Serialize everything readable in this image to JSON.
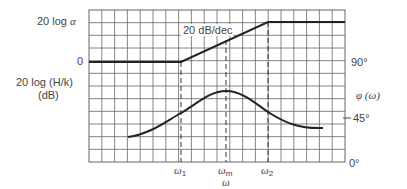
{
  "figure": {
    "left_axis": {
      "top_label_prefix": "20 log ",
      "top_label_var": "α",
      "zero_label": "0",
      "title_line1": "20 log (H/k)",
      "title_line2": "(dB)"
    },
    "right_axis": {
      "title": "φ (ω)",
      "ticks": [
        "90°",
        "45°",
        "0°"
      ]
    },
    "x_axis": {
      "title": "ω",
      "markers": [
        {
          "sym": "ω",
          "sub": "1"
        },
        {
          "sym": "ω",
          "sub": "m"
        },
        {
          "sym": "ω",
          "sub": "2"
        }
      ]
    },
    "annotation": "20 dB/dec",
    "colors": {
      "grid": "#555555",
      "curve": "#222222",
      "background": "#ffffff"
    }
  },
  "chart_data": {
    "type": "line",
    "xlabel": "ω",
    "ylabel_left": "20 log (H/k) (dB)",
    "ylabel_right": "φ (ω)",
    "grid": true,
    "x_markers": [
      "ω1",
      "ωm",
      "ω2"
    ],
    "series": [
      {
        "name": "Magnitude (asymptotic)",
        "axis": "left",
        "points": [
          {
            "x": "low",
            "y": "0"
          },
          {
            "x": "ω1",
            "y": "0"
          },
          {
            "x": "ω2",
            "y": "20 log α"
          },
          {
            "x": "high",
            "y": "20 log α"
          }
        ],
        "slope_label": "20 dB/dec"
      },
      {
        "name": "Phase",
        "axis": "right",
        "yticks": [
          "0°",
          "45°",
          "90°"
        ],
        "points": [
          {
            "x": "start",
            "y_deg": 12
          },
          {
            "x": "ω1",
            "y_deg": 24
          },
          {
            "x": "ωm",
            "y_deg": 34
          },
          {
            "x": "ω2",
            "y_deg": 25
          },
          {
            "x": "end",
            "y_deg": 17
          }
        ]
      }
    ]
  }
}
